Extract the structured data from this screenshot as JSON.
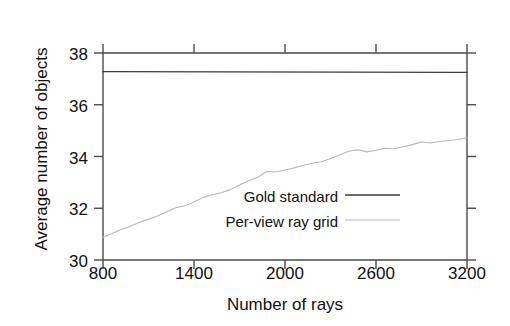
{
  "chart_data": {
    "type": "line",
    "title": "",
    "xlabel": "Number of rays",
    "ylabel": "Average number of objects",
    "xlim": [
      800,
      3200
    ],
    "ylim": [
      30,
      38
    ],
    "xticks": [
      800,
      1400,
      2000,
      2600,
      3200
    ],
    "yticks": [
      30,
      32,
      34,
      36,
      38
    ],
    "grid": false,
    "legend_position": "inside-lower-right",
    "series": [
      {
        "name": "Gold standard",
        "color": "#3a3a3a",
        "x": [
          800,
          3200
        ],
        "values": [
          37.28,
          37.25
        ]
      },
      {
        "name": "Per-view ray grid",
        "color": "#b8b8b8",
        "x": [
          800,
          860,
          920,
          980,
          1040,
          1100,
          1160,
          1220,
          1280,
          1340,
          1400,
          1460,
          1520,
          1580,
          1640,
          1700,
          1760,
          1820,
          1880,
          1940,
          2000,
          2060,
          2120,
          2180,
          2240,
          2300,
          2360,
          2420,
          2480,
          2540,
          2600,
          2660,
          2720,
          2780,
          2840,
          2900,
          2960,
          3020,
          3080,
          3140,
          3200
        ],
        "values": [
          30.88,
          31.02,
          31.18,
          31.3,
          31.45,
          31.58,
          31.7,
          31.86,
          32.02,
          32.1,
          32.24,
          32.42,
          32.52,
          32.6,
          32.72,
          32.9,
          33.06,
          33.2,
          33.42,
          33.4,
          33.48,
          33.56,
          33.66,
          33.74,
          33.8,
          33.92,
          34.06,
          34.2,
          34.26,
          34.18,
          34.24,
          34.32,
          34.3,
          34.38,
          34.46,
          34.56,
          34.52,
          34.58,
          34.62,
          34.66,
          34.72
        ]
      }
    ]
  },
  "axis": {
    "ylabel": "Average number of objects",
    "xlabel": "Number of rays",
    "ytick_labels": [
      "38",
      "36",
      "34",
      "32",
      "30"
    ],
    "xtick_labels": [
      "800",
      "1400",
      "2000",
      "2600",
      "3200"
    ]
  },
  "legend": {
    "entries": [
      {
        "label": "Gold standard",
        "color": "#3a3a3a"
      },
      {
        "label": "Per-view ray grid",
        "color": "#b8b8b8"
      }
    ]
  },
  "colors": {
    "background": "#ffffff",
    "frame": "#4a4a4a",
    "gold_standard": "#3a3a3a",
    "per_view_ray_grid": "#b8b8b8",
    "text": "#111111"
  }
}
